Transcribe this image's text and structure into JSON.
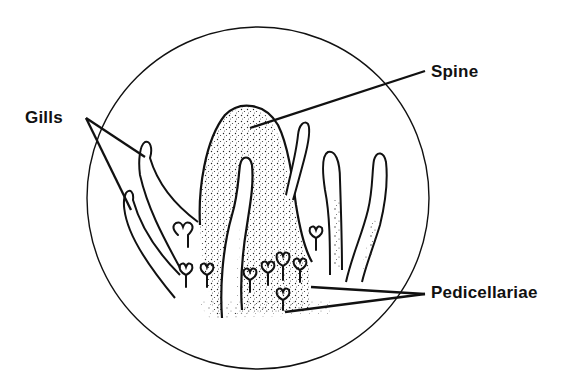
{
  "diagram": {
    "labels": {
      "gills": "Gills",
      "spine": "Spine",
      "pedicellariae": "Pedicellariae"
    },
    "caption_fragment": "",
    "colors": {
      "ink": "#111111",
      "background": "#ffffff"
    }
  }
}
